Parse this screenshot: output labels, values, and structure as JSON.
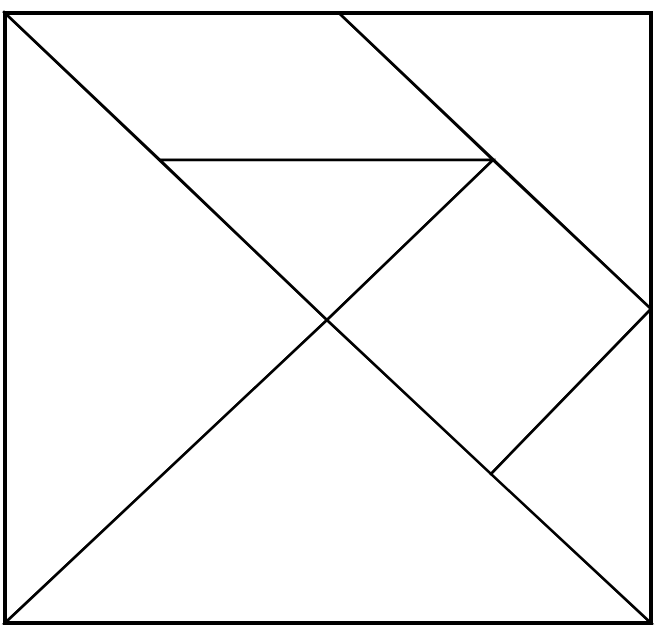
{
  "diagram": {
    "type": "tangram",
    "colors": {
      "stroke": "#000000",
      "fill": "#ffffff",
      "background": "#ffffff"
    },
    "square": {
      "top_left": [
        5,
        13
      ],
      "top_right": [
        651,
        13
      ],
      "bottom_right": [
        651,
        623
      ],
      "bottom_left": [
        5,
        623
      ]
    },
    "vertices": {
      "TL": [
        5,
        13
      ],
      "TM": [
        339,
        13
      ],
      "TR": [
        651,
        13
      ],
      "RM": [
        651,
        309
      ],
      "BR": [
        651,
        623
      ],
      "BL": [
        5,
        623
      ],
      "C": [
        327,
        320
      ],
      "P": [
        160,
        160
      ],
      "Q": [
        493,
        160
      ],
      "R": [
        491,
        474
      ]
    },
    "pieces": [
      {
        "id": "large-triangle-left",
        "kind": "large triangle",
        "points": "5,13 327,320 5,623"
      },
      {
        "id": "large-triangle-bottom",
        "kind": "large triangle",
        "points": "5,623 327,320 651,623"
      },
      {
        "id": "parallelogram-top",
        "kind": "parallelogram",
        "points": "5,13 339,13 493,160 160,160"
      },
      {
        "id": "medium-triangle-top-right",
        "kind": "medium triangle",
        "points": "339,13 651,13 651,309"
      },
      {
        "id": "small-triangle-center",
        "kind": "small triangle",
        "points": "160,160 493,160 327,320"
      },
      {
        "id": "square-right",
        "kind": "square",
        "points": "493,160 651,309 491,474 327,320"
      },
      {
        "id": "small-triangle-bottom-right",
        "kind": "small triangle",
        "points": "651,309 651,623 491,474"
      }
    ]
  }
}
